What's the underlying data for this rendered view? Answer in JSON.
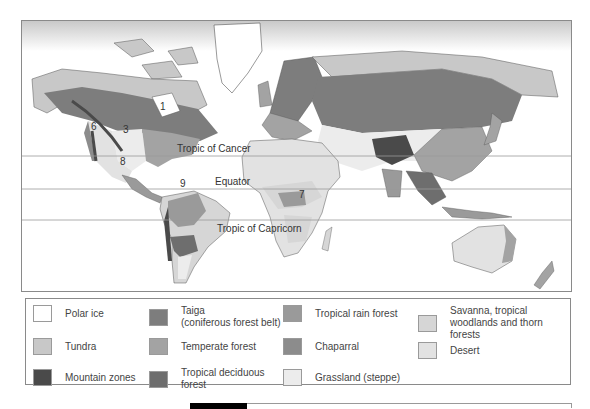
{
  "map": {
    "lines": {
      "tropic_of_cancer": "Tropic of Cancer",
      "equator": "Equator",
      "tropic_of_capricorn": "Tropic of Capricorn"
    },
    "region_numbers": [
      "3",
      "6",
      "8",
      "9",
      "7",
      "1"
    ]
  },
  "legend": {
    "items": [
      {
        "label": "Polar ice",
        "color": "#ffffff"
      },
      {
        "label": "Taiga\n(coniferous forest belt)",
        "label_line1": "Taiga",
        "label_line2": "(coniferous forest belt)",
        "color": "#7d7d7d"
      },
      {
        "label": "Tropical rain forest",
        "color": "#9a9a9a"
      },
      {
        "label": "Savanna, tropical woodlands and thorn forests",
        "label_line1": "Savanna, tropical",
        "label_line2": "woodlands and thorn forests",
        "color": "#d6d6d6"
      },
      {
        "label": "Tundra",
        "color": "#c8c8c8"
      },
      {
        "label": "Temperate forest",
        "color": "#a3a3a3"
      },
      {
        "label": "Chaparral",
        "color": "#8c8c8c"
      },
      {
        "label": "Desert",
        "color": "#e2e2e2"
      },
      {
        "label": "Mountain zones",
        "color": "#4a4a4a"
      },
      {
        "label": "Tropical deciduous forest",
        "label_line1": "Tropical deciduous",
        "label_line2": "forest",
        "color": "#6e6e6e"
      },
      {
        "label": "Grassland (steppe)",
        "color": "#ececec"
      }
    ]
  }
}
